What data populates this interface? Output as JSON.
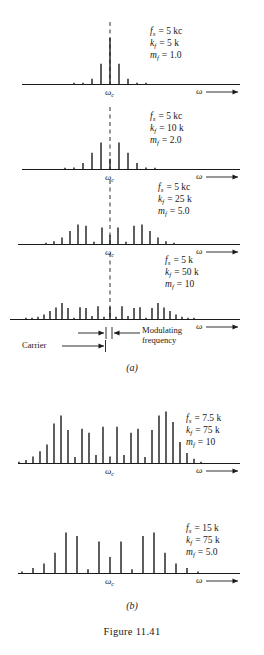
{
  "caption": "Figure 11.41",
  "sub_labels": {
    "a": "(a)",
    "b": "(b)"
  },
  "axis": {
    "omega_c": "ω",
    "omega_c_sub": "c",
    "omega": "ω"
  },
  "annotations": {
    "carrier": "Carrier",
    "modulating_line1": "Modulating",
    "modulating_line2": "frequency"
  },
  "symbols": {
    "fs": "f",
    "fs_sub": "s",
    "kf": "k",
    "kf_sub": "f",
    "mf": "m",
    "mf_sub": "f",
    "equals": "="
  },
  "chart_data": [
    {
      "id": "panel-a1",
      "type": "bar",
      "title": "FM spectrum, m_f = 1.0",
      "xlabel": "ω",
      "ylabel": "",
      "params": {
        "fs": "5 kc",
        "kf": "5 k",
        "mf": "1.0"
      },
      "carrier_index": 0,
      "grid": false,
      "n": [
        -4,
        -3,
        -2,
        -1,
        0,
        1,
        2,
        3,
        4
      ],
      "values": [
        0.002,
        0.02,
        0.115,
        0.44,
        1.0,
        0.44,
        0.115,
        0.02,
        0.002
      ],
      "ylim": [
        0,
        1
      ]
    },
    {
      "id": "panel-a2",
      "type": "bar",
      "title": "FM spectrum, m_f = 2.0",
      "xlabel": "ω",
      "ylabel": "",
      "params": {
        "fs": "5 kc",
        "kf": "10 k",
        "mf": "2.0"
      },
      "carrier_index": 0,
      "grid": false,
      "n": [
        -5,
        -4,
        -3,
        -2,
        -1,
        0,
        1,
        2,
        3,
        4,
        5
      ],
      "values": [
        0.007,
        0.034,
        0.129,
        0.353,
        0.577,
        0.224,
        0.577,
        0.353,
        0.129,
        0.034,
        0.007
      ],
      "ylim": [
        0,
        1
      ]
    },
    {
      "id": "panel-a3",
      "type": "bar",
      "title": "FM spectrum, m_f = 5.0",
      "xlabel": "ω",
      "ylabel": "",
      "params": {
        "fs": "5 kc",
        "kf": "25 k",
        "mf": "5.0"
      },
      "carrier_index": 0,
      "grid": false,
      "n": [
        -8,
        -7,
        -6,
        -5,
        -4,
        -3,
        -2,
        -1,
        0,
        1,
        2,
        3,
        4,
        5,
        6,
        7,
        8
      ],
      "values": [
        0.018,
        0.053,
        0.131,
        0.261,
        0.391,
        0.365,
        0.047,
        0.328,
        0.178,
        0.328,
        0.047,
        0.365,
        0.391,
        0.261,
        0.131,
        0.053,
        0.018
      ],
      "ylim": [
        0,
        1
      ]
    },
    {
      "id": "panel-a4",
      "type": "bar",
      "title": "FM spectrum, m_f = 10",
      "xlabel": "ω",
      "ylabel": "",
      "params": {
        "fs": "5 k",
        "kf": "50 k",
        "mf": "10"
      },
      "carrier_index": 0,
      "grid": false,
      "n": [
        -14,
        -13,
        -12,
        -11,
        -10,
        -9,
        -8,
        -7,
        -6,
        -5,
        -4,
        -3,
        -2,
        -1,
        0,
        1,
        2,
        3,
        4,
        5,
        6,
        7,
        8,
        9,
        10,
        11,
        12,
        13,
        14
      ],
      "values": [
        0.008,
        0.019,
        0.045,
        0.092,
        0.162,
        0.231,
        0.318,
        0.22,
        0.014,
        0.234,
        0.22,
        0.058,
        0.255,
        0.043,
        0.246,
        0.043,
        0.255,
        0.058,
        0.22,
        0.234,
        0.014,
        0.22,
        0.318,
        0.231,
        0.162,
        0.092,
        0.045,
        0.019,
        0.008
      ],
      "ylim": [
        0,
        1
      ]
    },
    {
      "id": "panel-b1",
      "type": "bar",
      "title": "FM spectrum, m_f = 10",
      "xlabel": "ω",
      "ylabel": "",
      "params": {
        "fs": "7.5 k",
        "kf": "75 k",
        "mf": "10"
      },
      "carrier_index": 0,
      "grid": false,
      "n": [
        -13,
        -12,
        -11,
        -10,
        -9,
        -8,
        -7,
        -6,
        -5,
        -4,
        -3,
        -2,
        -1,
        0,
        1,
        2,
        3,
        4,
        5,
        6,
        7,
        8,
        9,
        10,
        11,
        12,
        13
      ],
      "values": [
        0.02,
        0.047,
        0.1,
        0.178,
        0.28,
        0.6,
        0.72,
        0.5,
        0.09,
        0.52,
        0.46,
        0.12,
        0.55,
        0.1,
        0.55,
        0.12,
        0.46,
        0.52,
        0.09,
        0.5,
        0.72,
        0.78,
        0.62,
        0.32,
        0.15,
        0.065,
        0.02
      ],
      "ylim": [
        0,
        1
      ]
    },
    {
      "id": "panel-b2",
      "type": "bar",
      "title": "FM spectrum, m_f = 5.0",
      "xlabel": "ω",
      "ylabel": "",
      "params": {
        "fs": "15 k",
        "kf": "75 k",
        "mf": "5.0"
      },
      "carrier_index": 0,
      "grid": false,
      "n": [
        -8,
        -7,
        -6,
        -5,
        -4,
        -3,
        -2,
        -1,
        0,
        1,
        2,
        3,
        4,
        5,
        6,
        7,
        8
      ],
      "values": [
        0.02,
        0.07,
        0.135,
        0.29,
        0.58,
        0.53,
        0.055,
        0.45,
        0.23,
        0.45,
        0.055,
        0.53,
        0.58,
        0.29,
        0.135,
        0.07,
        0.02
      ],
      "ylim": [
        0,
        1
      ]
    }
  ]
}
